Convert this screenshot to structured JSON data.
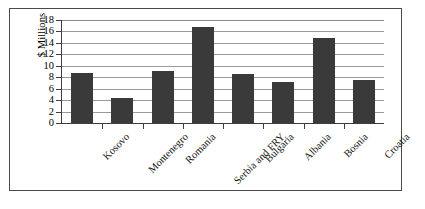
{
  "figure": {
    "background_color": "#ffffff",
    "frame_color": "#4a4a4a",
    "bar_color": "#3a3a3a",
    "gridline_color": "#9a9a9a",
    "axis_color": "#3d3d3d"
  },
  "chart_data": {
    "type": "bar",
    "title": "",
    "xlabel": "",
    "ylabel": "$ Millions",
    "categories": [
      "Kosovo",
      "Montenegro",
      "Romania",
      "Serbia and FRY",
      "Bulgaria",
      "Albania",
      "Bosnia",
      "Croatia"
    ],
    "values": [
      8.7,
      4.4,
      9.0,
      16.8,
      8.6,
      7.2,
      14.9,
      7.6
    ],
    "ylim": [
      0,
      18
    ],
    "ytick_labels": [
      "0",
      "2",
      "4",
      "6",
      "8",
      "10",
      "12",
      "14",
      "16",
      "18"
    ],
    "ytick_values": [
      0,
      2,
      4,
      6,
      8,
      10,
      12,
      14,
      16,
      18
    ],
    "grid": true,
    "grid_axis": "y",
    "legend": false,
    "legend_position": "none",
    "series": [
      {
        "name": "$ Millions",
        "values": [
          8.7,
          4.4,
          9.0,
          16.8,
          8.6,
          7.2,
          14.9,
          7.6
        ]
      }
    ]
  }
}
